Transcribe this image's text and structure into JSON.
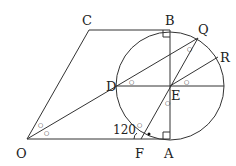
{
  "figure": {
    "type": "geometry",
    "points": {
      "O": {
        "label": "O",
        "x": 27,
        "y": 139
      },
      "A": {
        "label": "A",
        "x": 170,
        "y": 139
      },
      "B": {
        "label": "B",
        "x": 170,
        "y": 30
      },
      "C": {
        "label": "C",
        "x": 89,
        "y": 30
      },
      "D": {
        "label": "D",
        "x": 118,
        "y": 86
      },
      "E": {
        "label": "E",
        "x": 170,
        "y": 86
      },
      "F": {
        "label": "F",
        "x": 141,
        "y": 139
      },
      "Q": {
        "label": "Q",
        "x": 198,
        "y": 38
      },
      "R": {
        "label": "R",
        "x": 218,
        "y": 57
      }
    },
    "circle": {
      "center": "E",
      "radius": 54
    },
    "angle_label": "120",
    "angle_mark_symbol": "°",
    "equal_angle_mark": "○",
    "colors": {
      "stroke": "#333333",
      "text": "#222222"
    }
  }
}
